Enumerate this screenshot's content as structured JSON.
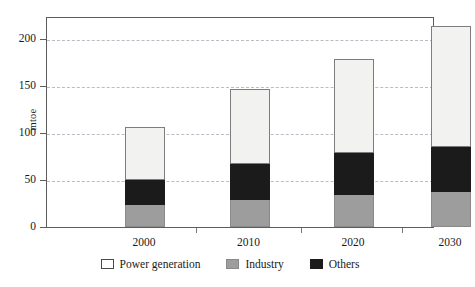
{
  "chart_data": {
    "type": "bar",
    "title": "",
    "xlabel": "",
    "ylabel": "mtoe",
    "categories": [
      "2000",
      "2010",
      "2020",
      "2030"
    ],
    "ylim": [
      0,
      220
    ],
    "yticks": [
      0,
      50,
      100,
      150,
      200
    ],
    "ytick_labels": [
      "0",
      "50",
      "100",
      "150",
      "200"
    ],
    "grid": true,
    "stacked": true,
    "legend_position": "bottom",
    "series": [
      {
        "name": "Industry",
        "color": "#9d9d9d",
        "values": [
          23,
          29,
          34,
          37
        ]
      },
      {
        "name": "Others",
        "color": "#1b1b1b",
        "values": [
          27,
          38,
          45,
          48
        ]
      },
      {
        "name": "Power generation",
        "color": "#f2f2f0",
        "values": [
          55,
          79,
          98,
          128
        ]
      }
    ],
    "totals": [
      105,
      146,
      177,
      213
    ]
  },
  "legend": {
    "items": [
      {
        "label": "Power generation",
        "swatch": "power"
      },
      {
        "label": "Industry",
        "swatch": "industry"
      },
      {
        "label": "Others",
        "swatch": "others"
      }
    ]
  }
}
